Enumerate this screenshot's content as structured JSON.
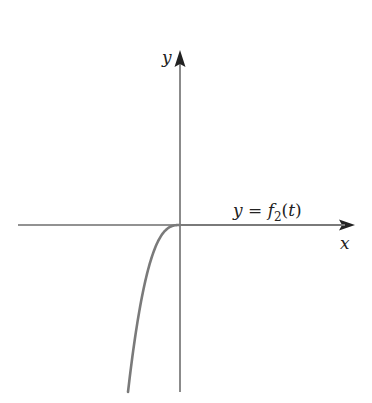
{
  "chart_data": {
    "type": "line",
    "title": "",
    "xlabel": "x",
    "ylabel": "y",
    "series": [
      {
        "name": "y = f2(t)",
        "description": "Zero for t >= 0; for t < 0 decreases steeply (smooth, like -t^3 shape) toward negative values",
        "points_px": [
          [
            128,
            392
          ],
          [
            141,
            300
          ],
          [
            150,
            270
          ],
          [
            160,
            240
          ],
          [
            170,
            228
          ],
          [
            180,
            225
          ],
          [
            355,
            225
          ]
        ]
      }
    ],
    "grid": false,
    "legend": "none"
  },
  "axes": {
    "x_label": "x",
    "y_label": "y",
    "colors": {
      "axis": "#6e6e6e",
      "curve": "#7a7a7a",
      "text": "#222222"
    }
  },
  "annotation": {
    "lhs": "y = ",
    "f": "f",
    "sub": "2",
    "rhs": "(t)"
  }
}
